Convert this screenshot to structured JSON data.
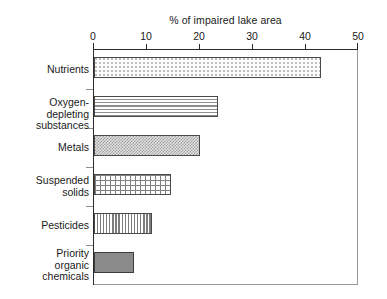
{
  "chart_data": {
    "type": "bar",
    "orientation": "horizontal",
    "title": "",
    "xlabel": "% of impaired lake area",
    "ylabel": "",
    "xlim": [
      0,
      50
    ],
    "xticks": [
      0,
      10,
      20,
      30,
      40,
      50
    ],
    "xtick_labels": [
      "0",
      "10",
      "20",
      "30",
      "40",
      "50"
    ],
    "grid": false,
    "legend": "none",
    "categories": [
      "Nutrients",
      "Oxygen-\ndepleting\nsubstances",
      "Metals",
      "Suspended\nsolids",
      "Pesticides",
      "Priority\norganic\nchemicals"
    ],
    "values": [
      43,
      23.5,
      20,
      14.5,
      11,
      7.5
    ],
    "bars": [
      {
        "label": "Nutrients",
        "value": 43,
        "pattern": "light-dots",
        "color": "#fcfcfc"
      },
      {
        "label": "Oxygen-\ndepleting\nsubstances",
        "value": 23.5,
        "pattern": "horizontal-lines",
        "color": "#fafafa"
      },
      {
        "label": "Metals",
        "value": 20,
        "pattern": "fine-checker",
        "color": "#c9c9c9"
      },
      {
        "label": "Suspended\nsolids",
        "value": 14.5,
        "pattern": "crosshatch-grid",
        "color": "#fbfbfb"
      },
      {
        "label": "Pesticides",
        "value": 11,
        "pattern": "vertical-lines",
        "color": "#fafafa"
      },
      {
        "label": "Priority\norganic\nchemicals",
        "value": 7.5,
        "pattern": "solid-gray",
        "color": "#8a8a8a"
      }
    ]
  },
  "axis": {
    "title": "% of impaired lake area",
    "ticks": [
      "0",
      "10",
      "20",
      "30",
      "40",
      "50"
    ]
  },
  "colors": {
    "axis_line": "#2b2b2b",
    "frame_line": "#9a9a9a",
    "bar_outline": "#4a4a4a",
    "text": "#1a1a1a",
    "background": "#ffffff"
  }
}
